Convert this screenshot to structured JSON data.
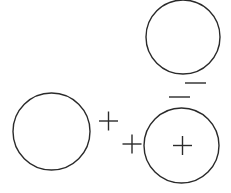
{
  "diagram": {
    "stroke_color": "#2a2a2a",
    "background": "#ffffff",
    "circles": [
      {
        "name": "top-right-circle",
        "cx": 183,
        "cy": 37,
        "r": 37
      },
      {
        "name": "left-circle",
        "cx": 51.5,
        "cy": 131.5,
        "r": 38.5
      },
      {
        "name": "bottom-right-circle",
        "cx": 181.5,
        "cy": 145.5,
        "r": 37.5
      }
    ],
    "plus_signs": [
      {
        "name": "plus-between",
        "cx": 108.5,
        "cy": 121,
        "size": 19
      },
      {
        "name": "plus-outside-bottom-circle",
        "cx": 132,
        "cy": 144,
        "size": 19
      },
      {
        "name": "plus-inside-bottom-circle",
        "cx": 182.5,
        "cy": 145.5,
        "size": 19
      }
    ],
    "minus_signs": [
      {
        "name": "minus-upper",
        "x1": 185,
        "x2": 206,
        "y": 83
      },
      {
        "name": "minus-lower",
        "x1": 169,
        "x2": 190,
        "y": 97
      }
    ]
  }
}
